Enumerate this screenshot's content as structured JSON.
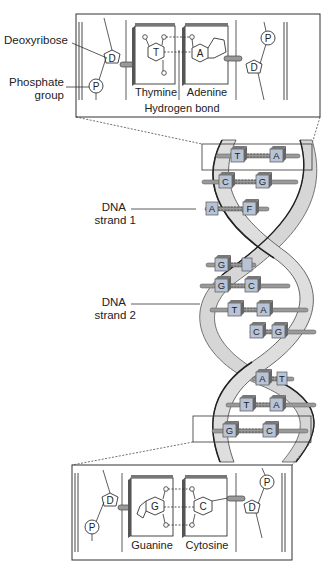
{
  "diagram": {
    "colors": {
      "line": "#333333",
      "strand_fill": "#d4d4d4",
      "strand_edge": "#444444",
      "base_fill": "#b9c3d6",
      "base_dark": "#6f6f6f",
      "background": "#ffffff"
    },
    "labels": {
      "deoxyribose": "Deoxyribose",
      "phosphate_line1": "Phosphate",
      "phosphate_line2": "group",
      "hydrogen_bond": "Hydrogen bond",
      "strand1_line1": "DNA",
      "strand1_line2": "strand 1",
      "strand2_line1": "DNA",
      "strand2_line2": "strand 2"
    },
    "top_inset": {
      "left_base": "Thymine",
      "right_base": "Adenine",
      "left_letter": "T",
      "right_letter": "A",
      "sugar": "D",
      "phosphate": "P"
    },
    "bottom_inset": {
      "left_base": "Guanine",
      "right_base": "Cytosine",
      "left_letter": "G",
      "right_letter": "C",
      "sugar": "D",
      "phosphate": "P"
    },
    "base_pairs": [
      {
        "left": "T",
        "right": "A"
      },
      {
        "left": "C",
        "right": "G"
      },
      {
        "left": "A",
        "right": "F"
      },
      {
        "left": "G",
        "right": "T"
      },
      {
        "left": "G",
        "right": "C"
      },
      {
        "left": "T",
        "right": "A"
      },
      {
        "left": "C",
        "right": "G"
      },
      {
        "left": "A",
        "right": "T"
      },
      {
        "left": "T",
        "right": "A"
      },
      {
        "left": "G",
        "right": "C"
      }
    ]
  }
}
